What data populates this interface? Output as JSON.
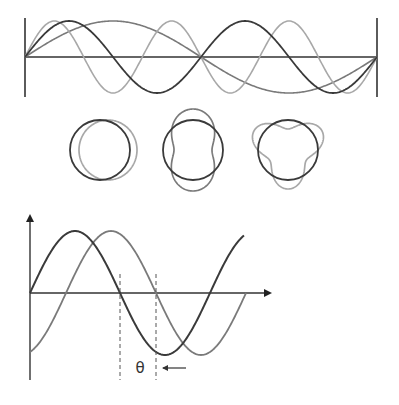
{
  "diagram": {
    "title": "",
    "colors": {
      "axis": "#333333",
      "dark": "#3a3a3a",
      "medium": "#7a7a7a",
      "light": "#a8a8a8",
      "background": "#ffffff"
    },
    "top_panel": {
      "description": "Standing-wave harmonics on a string fixed at both ends",
      "left_x": 25,
      "right_x": 377,
      "axis_y": 57,
      "amplitude": 36,
      "end_line_top": 18,
      "end_line_bottom": 97,
      "waves": [
        {
          "name": "harmonic-1",
          "cycles": 1,
          "color": "medium"
        },
        {
          "name": "harmonic-2",
          "cycles": 2,
          "color": "dark"
        },
        {
          "name": "harmonic-3",
          "cycles": 3,
          "color": "light"
        }
      ]
    },
    "circle_panel": {
      "description": "Circular standing waves with n = 1, 2, 3 lobes",
      "radius": 30,
      "items": [
        {
          "name": "circle-mode-1",
          "cx": 100,
          "cy": 150,
          "lobes": 1,
          "wave_color": "light"
        },
        {
          "name": "circle-mode-2",
          "cx": 193,
          "cy": 150,
          "lobes": 2,
          "wave_color": "medium"
        },
        {
          "name": "circle-mode-3",
          "cx": 288,
          "cy": 150,
          "lobes": 3,
          "wave_color": "light"
        }
      ]
    },
    "phase_panel": {
      "description": "Two sine waves offset by phase angle theta",
      "origin_x": 30,
      "axis_y": 293,
      "y_axis_top": 216,
      "y_axis_bottom": 380,
      "x_axis_end": 270,
      "amplitude": 62,
      "period": 180,
      "phase_shift_px": 36,
      "dark_wave_end_x": 244,
      "light_wave_end_x": 246,
      "dashed_lines_x": [
        120,
        156
      ],
      "dashed_top": 274,
      "dashed_bottom": 380,
      "label": "θ",
      "label_x": 140,
      "label_y": 373,
      "arrow": {
        "from_x": 186,
        "to_x": 163,
        "y": 368
      }
    }
  }
}
